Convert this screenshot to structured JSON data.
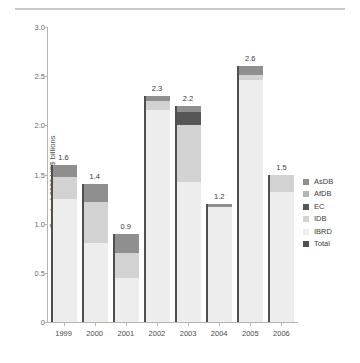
{
  "chart_data": {
    "type": "bar",
    "title": "",
    "subtitle": "",
    "xlabel": "",
    "ylabel": "Constant 2006 US$ billions",
    "ylim": [
      0,
      3.0
    ],
    "ytick_labels": [
      "0",
      "0.5",
      "1.0",
      "1.5",
      "2.0",
      "2.5",
      "3.0"
    ],
    "ytick_values": [
      0,
      0.5,
      1.0,
      1.5,
      2.0,
      2.5,
      3.0
    ],
    "grid": false,
    "stacked": true,
    "legend_position": "right",
    "categories": [
      "1999",
      "2000",
      "2001",
      "2002",
      "2003",
      "2004",
      "2005",
      "2006"
    ],
    "data_labels": [
      "1.6",
      "1.4",
      "0.9",
      "2.3",
      "2.2",
      "1.2",
      "2.6",
      "1.5"
    ],
    "totals": [
      1.6,
      1.4,
      0.9,
      2.3,
      2.2,
      1.2,
      2.6,
      1.5
    ],
    "series": [
      {
        "name": "IBRD",
        "color": "#ededed",
        "values": [
          1.25,
          0.8,
          0.45,
          2.16,
          1.42,
          1.17,
          2.46,
          1.32
        ]
      },
      {
        "name": "IDB",
        "color": "#d2d2d2",
        "values": [
          0.22,
          0.42,
          0.25,
          0.09,
          0.58,
          0.0,
          0.05,
          0.18
        ]
      },
      {
        "name": "EC",
        "color": "#565656",
        "values": [
          0.0,
          0.0,
          0.0,
          0.0,
          0.14,
          0.0,
          0.0,
          0.0
        ]
      },
      {
        "name": "AfDB",
        "color": "#b5b5b5",
        "values": [
          0.0,
          0.0,
          0.0,
          0.0,
          0.0,
          0.0,
          0.0,
          0.0
        ]
      },
      {
        "name": "AsDB",
        "color": "#8f8f8f",
        "values": [
          0.13,
          0.18,
          0.2,
          0.05,
          0.06,
          0.03,
          0.09,
          0.0
        ]
      }
    ]
  },
  "legend": {
    "items": [
      {
        "label": "AsDB",
        "color": "#8f8f8f"
      },
      {
        "label": "AfDB",
        "color": "#b5b5b5"
      },
      {
        "label": "EC",
        "color": "#565656"
      },
      {
        "label": "IDB",
        "color": "#d2d2d2"
      },
      {
        "label": "IBRD",
        "color": "#ededed"
      },
      {
        "label": "Total",
        "color": "#4f4f4f"
      }
    ]
  },
  "colors": {
    "axis": "#b4b4b4",
    "text": "#3b3b3b",
    "rule": "#c9c9c9",
    "bar_edge": "#4f4f4f"
  }
}
